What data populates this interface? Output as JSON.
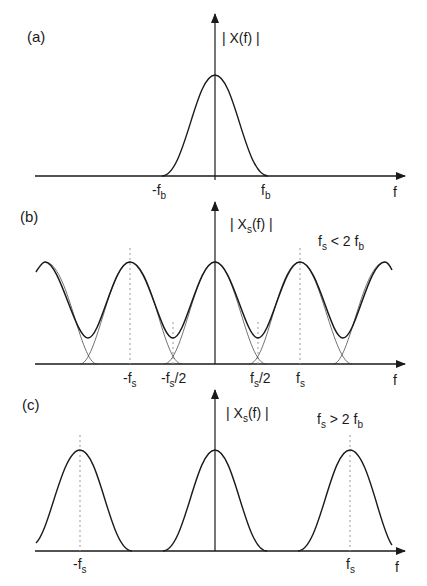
{
  "panels": {
    "a": {
      "label": "(a)",
      "ylabel_pre": "| X(f) |",
      "ticks": {
        "neg_fb": {
          "main": "-f",
          "sub": "b"
        },
        "fb": {
          "main": "f",
          "sub": "b"
        }
      },
      "xlabel": "f"
    },
    "b": {
      "label": "(b)",
      "ylabel": {
        "pre": "| X",
        "sub": "s",
        "post": "(f) |"
      },
      "condition": {
        "a": "f",
        "a_sub": "s",
        "mid": " < 2 f",
        "b_sub": "b"
      },
      "ticks": {
        "neg_fs": {
          "main": "-f",
          "sub": "s"
        },
        "neg_fs2": {
          "main": "-f",
          "sub": "s",
          "post": "/2"
        },
        "fs2": {
          "main": "f",
          "sub": "s",
          "post": "/2"
        },
        "fs": {
          "main": "f",
          "sub": "s"
        }
      },
      "xlabel": "f"
    },
    "c": {
      "label": "(c)",
      "ylabel": {
        "pre": "| X",
        "sub": "s",
        "post": "(f) |"
      },
      "condition": {
        "a": "f",
        "a_sub": "s",
        "mid": " > 2 f",
        "b_sub": "b"
      },
      "ticks": {
        "neg_fs": {
          "main": "-f",
          "sub": "s"
        },
        "fs": {
          "main": "f",
          "sub": "s"
        }
      },
      "xlabel": "f"
    }
  },
  "colors": {
    "stroke": "#1a1a1a",
    "dotted": "#999999"
  }
}
